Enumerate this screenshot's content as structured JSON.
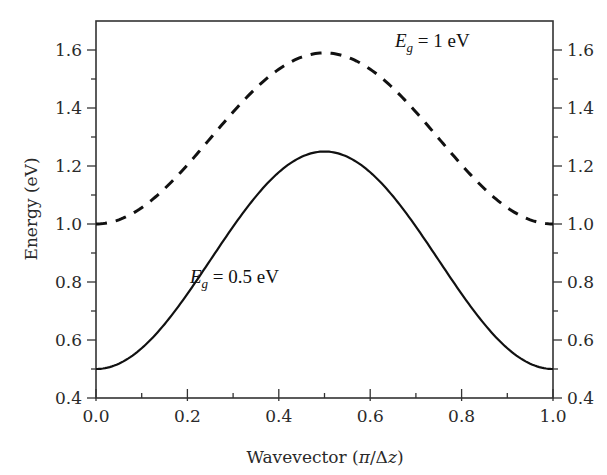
{
  "chart_data": {
    "type": "line",
    "title": "",
    "xlabel": "Wavevector (π/Δz)",
    "ylabel": "Energy (eV)",
    "xlim": [
      0.0,
      1.0
    ],
    "ylim": [
      0.4,
      1.7
    ],
    "x_ticks": [
      "0.0",
      "0.2",
      "0.4",
      "0.6",
      "0.8",
      "1.0"
    ],
    "x_minor_step": 0.1,
    "y_ticks": [
      "0.4",
      "0.6",
      "0.8",
      "1.0",
      "1.2",
      "1.4",
      "1.6"
    ],
    "y_minor_step": 0.1,
    "right_axis_mirrors_left": true,
    "grid": false,
    "legend": "none (inline annotations)",
    "x": [
      0.0,
      0.1,
      0.2,
      0.3,
      0.4,
      0.5,
      0.6,
      0.7,
      0.8,
      0.9,
      1.0
    ],
    "series": [
      {
        "name": "E_g = 1 eV",
        "style": "dashed",
        "color": "#111111",
        "values": [
          1.0,
          1.06,
          1.2,
          1.39,
          1.53,
          1.59,
          1.53,
          1.39,
          1.2,
          1.06,
          1.0
        ]
      },
      {
        "name": "E_g = 0.5 eV",
        "style": "solid",
        "color": "#111111",
        "values": [
          0.5,
          0.57,
          0.76,
          1.01,
          1.18,
          1.25,
          1.18,
          1.01,
          0.76,
          0.57,
          0.5
        ]
      }
    ],
    "annotations": [
      {
        "text_main": "E",
        "text_sub": "g",
        "text_rest": " = 1 eV",
        "x": 0.62,
        "y": 1.56
      },
      {
        "text_main": "E",
        "text_sub": "g",
        "text_rest": " = 0.5 eV",
        "x": 0.165,
        "y": 0.85
      }
    ]
  },
  "labels": {
    "xlabel_main": "Wavevector (",
    "xlabel_pi": "π",
    "xlabel_slash": "/Δ",
    "xlabel_z": "z",
    "xlabel_close": ")",
    "ylabel": "Energy (eV)",
    "annot_top_E": "E",
    "annot_top_sub": "g",
    "annot_top_rest": " = 1 eV",
    "annot_bottom_E": "E",
    "annot_bottom_sub": "g",
    "annot_bottom_rest": " = 0.5 eV"
  },
  "colors": {
    "axis": "#333333",
    "line": "#111111",
    "background": "#ffffff"
  }
}
